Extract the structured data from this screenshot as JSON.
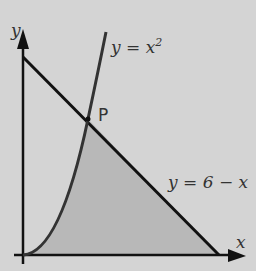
{
  "diagram": {
    "axes": {
      "x_label": "x",
      "y_label": "y"
    },
    "curves": [
      {
        "name": "parabola",
        "equation": "y = x²",
        "label_main": "y = x",
        "label_sup": "2"
      },
      {
        "name": "line",
        "equation": "y = 6 − x",
        "label": "y = 6 − x"
      }
    ],
    "point": {
      "label": "P",
      "x": 2,
      "y": 4
    },
    "shaded_region": "area under y = x² from 0 to 2 and under y = 6 − x from 2 to 6, above the x-axis",
    "colors": {
      "background": "#d4d4d4",
      "shade": "#b3b3b3",
      "curve": "#333333",
      "line": "#111111"
    }
  }
}
